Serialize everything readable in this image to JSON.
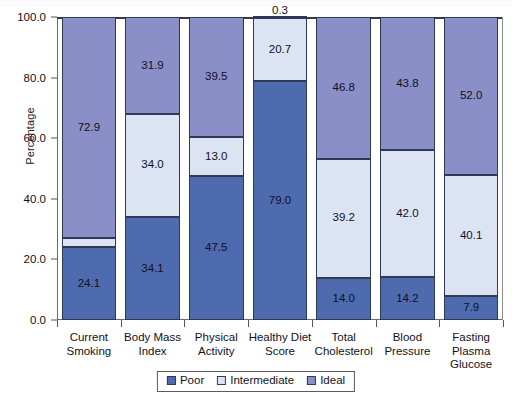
{
  "chart_data": {
    "type": "bar",
    "subtype": "stacked-bar-100",
    "title": "",
    "xlabel": "",
    "ylabel": "Percentage",
    "ylim": [
      0.0,
      100.0
    ],
    "ytick_labels": [
      "0.0",
      "20.0",
      "40.0",
      "60.0",
      "80.0",
      "100.0"
    ],
    "ytick_values": [
      0.0,
      20.0,
      40.0,
      60.0,
      80.0,
      100.0
    ],
    "grid": false,
    "legend_position": "bottom-center",
    "categories": [
      "Current Smoking",
      "Body Mass Index",
      "Physical Activity",
      "Healthy Diet Score",
      "Total Cholesterol",
      "Blood Pressure",
      "Fasting Plasma Glucose"
    ],
    "category_label_lines": [
      [
        "Current",
        "Smoking"
      ],
      [
        "Body Mass",
        "Index"
      ],
      [
        "Physical",
        "Activity"
      ],
      [
        "Healthy Diet",
        "Score"
      ],
      [
        "Total",
        "Cholesterol"
      ],
      [
        "Blood",
        "Pressure"
      ],
      [
        "Fasting",
        "Plasma",
        "Glucose"
      ]
    ],
    "series": [
      {
        "name": "Poor",
        "color": "#4e6bb0",
        "values": [
          24.1,
          34.1,
          47.5,
          79.0,
          14.0,
          14.2,
          7.9
        ],
        "labels": [
          "24.1",
          "34.1",
          "47.5",
          "79.0",
          "14.0",
          "14.2",
          "7.9"
        ]
      },
      {
        "name": "Intermediate",
        "color": "#dce3f2",
        "values": [
          3.0,
          34.0,
          13.0,
          20.7,
          39.2,
          42.0,
          40.1
        ],
        "labels": [
          "3.0",
          "34.0",
          "13.0",
          "20.7",
          "39.2",
          "42.0",
          "40.1"
        ]
      },
      {
        "name": "Ideal",
        "color": "#8a8fc8",
        "values": [
          72.9,
          31.9,
          39.5,
          0.3,
          46.8,
          43.8,
          52.0
        ],
        "labels": [
          "72.9",
          "31.9",
          "39.5",
          "0.3",
          "46.8",
          "43.8",
          "52.0"
        ]
      }
    ]
  },
  "legend": {
    "items": [
      {
        "label": "Poor",
        "color": "#4e6bb0"
      },
      {
        "label": "Intermediate",
        "color": "#dce3f2"
      },
      {
        "label": "Ideal",
        "color": "#8a8fc8"
      }
    ]
  },
  "axes": {
    "y_title": "Percentage"
  }
}
